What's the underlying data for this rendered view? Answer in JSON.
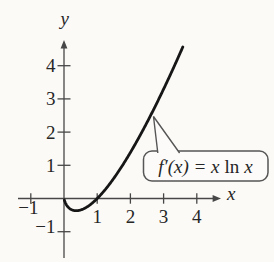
{
  "figure": {
    "background": "#fbfaf7",
    "axis_color": "#474747",
    "curve_color": "#161616",
    "text_color": "#262626",
    "callout_border": "#565656",
    "callout_fill": "#fcfbf9"
  },
  "axes": {
    "x_label": "x",
    "y_label": "y"
  },
  "callout": {
    "prefix": "f′(x) = x",
    "operator": "ln",
    "suffix": "x",
    "full_label": "f′(x) = x ln x"
  },
  "chart_data": {
    "type": "line",
    "title": "",
    "xlabel": "x",
    "ylabel": "y",
    "xlim": [
      -1.4,
      4.7
    ],
    "ylim": [
      -1.95,
      4.8
    ],
    "x_ticks": [
      -1,
      1,
      2,
      3,
      4
    ],
    "y_ticks": [
      1,
      2,
      3,
      4,
      -1
    ],
    "grid": false,
    "legend": false,
    "series": [
      {
        "name": "f'(x) = x ln x",
        "expression": "x * ln(x)",
        "domain": [
          0.01,
          3.58
        ],
        "sample_points": [
          [
            0.1,
            -0.23
          ],
          [
            0.368,
            -0.368
          ],
          [
            0.7,
            -0.25
          ],
          [
            1,
            0
          ],
          [
            1.5,
            0.61
          ],
          [
            2,
            1.39
          ],
          [
            2.5,
            2.29
          ],
          [
            3,
            3.3
          ],
          [
            3.58,
            4.57
          ]
        ],
        "x_intercepts": [
          1
        ],
        "minimum_point": [
          0.368,
          -0.368
        ]
      }
    ],
    "annotation": {
      "label": "f′(x) = x ln x",
      "arrow_points_to_xy": [
        2.63,
        2.48
      ]
    }
  }
}
